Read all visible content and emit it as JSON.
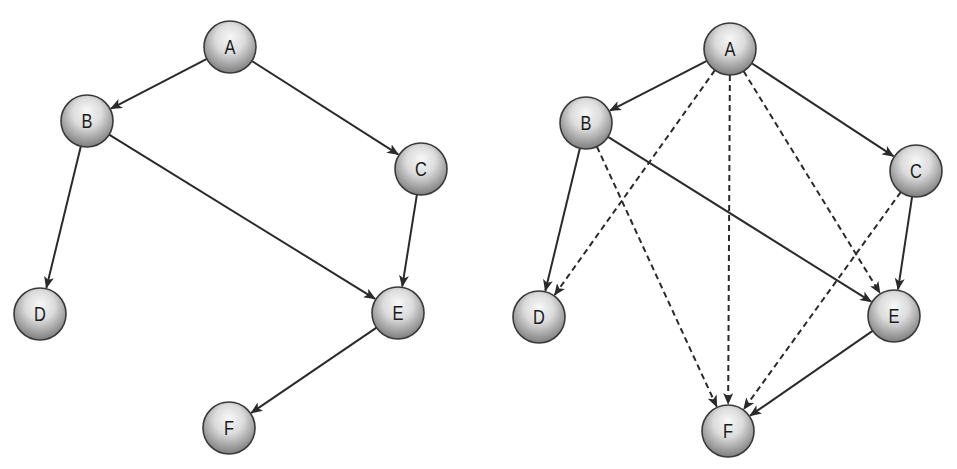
{
  "diagrams": [
    {
      "name": "original-graph",
      "nodes": [
        {
          "id": "A",
          "label": "A",
          "x": 230,
          "y": 47
        },
        {
          "id": "B",
          "label": "B",
          "x": 87,
          "y": 121
        },
        {
          "id": "C",
          "label": "C",
          "x": 421,
          "y": 169
        },
        {
          "id": "D",
          "label": "D",
          "x": 40,
          "y": 314
        },
        {
          "id": "E",
          "label": "E",
          "x": 398,
          "y": 313
        },
        {
          "id": "F",
          "label": "F",
          "x": 229,
          "y": 428
        }
      ],
      "edges": [
        {
          "from": "A",
          "to": "B",
          "style": "solid"
        },
        {
          "from": "A",
          "to": "C",
          "style": "solid"
        },
        {
          "from": "B",
          "to": "D",
          "style": "solid"
        },
        {
          "from": "B",
          "to": "E",
          "style": "solid"
        },
        {
          "from": "C",
          "to": "E",
          "style": "solid"
        },
        {
          "from": "E",
          "to": "F",
          "style": "solid"
        }
      ]
    },
    {
      "name": "transitive-closure-graph",
      "nodes": [
        {
          "id": "A",
          "label": "A",
          "x": 730,
          "y": 49
        },
        {
          "id": "B",
          "label": "B",
          "x": 586,
          "y": 123
        },
        {
          "id": "C",
          "label": "C",
          "x": 916,
          "y": 171
        },
        {
          "id": "D",
          "label": "D",
          "x": 539,
          "y": 317
        },
        {
          "id": "E",
          "label": "E",
          "x": 894,
          "y": 316
        },
        {
          "id": "F",
          "label": "F",
          "x": 728,
          "y": 431
        }
      ],
      "edges": [
        {
          "from": "A",
          "to": "B",
          "style": "solid"
        },
        {
          "from": "A",
          "to": "C",
          "style": "solid"
        },
        {
          "from": "B",
          "to": "D",
          "style": "solid"
        },
        {
          "from": "B",
          "to": "E",
          "style": "solid"
        },
        {
          "from": "C",
          "to": "E",
          "style": "solid"
        },
        {
          "from": "E",
          "to": "F",
          "style": "solid"
        },
        {
          "from": "A",
          "to": "D",
          "style": "dashed"
        },
        {
          "from": "A",
          "to": "F",
          "style": "dashed"
        },
        {
          "from": "A",
          "to": "E",
          "style": "dashed"
        },
        {
          "from": "B",
          "to": "F",
          "style": "dashed"
        },
        {
          "from": "C",
          "to": "F",
          "style": "dashed"
        }
      ]
    }
  ],
  "style": {
    "node_radius": 26,
    "edge_color": "#2a2a2a",
    "node_outline": "#3a3a3a",
    "node_light": "#f4f4f4",
    "node_dark": "#8a8a8a"
  }
}
